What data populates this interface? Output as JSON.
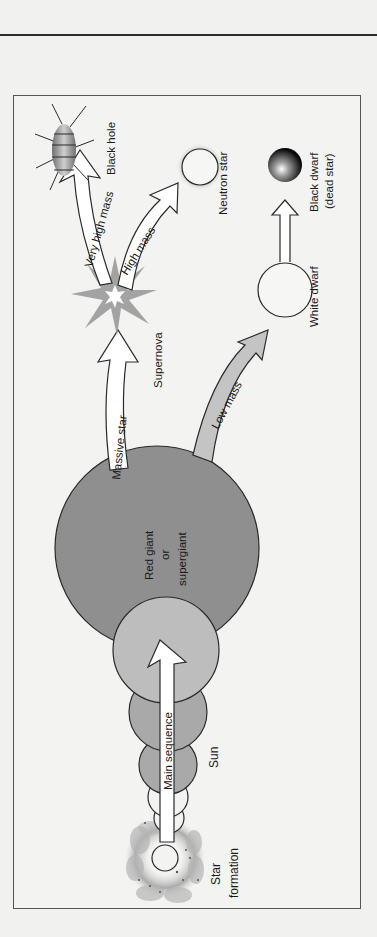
{
  "diagram": {
    "orientation": "rotated 90 degrees counter-clockwise",
    "stages": {
      "star_formation": {
        "line1": "Star",
        "line2": "formation"
      },
      "sun": "Sun",
      "main_sequence": "Main sequence",
      "red_giant": {
        "line1": "Red giant",
        "line2": "or",
        "line3": "supergiant"
      },
      "supernova": "Supernova",
      "black_hole": "Black hole",
      "neutron_star": "Neutron star",
      "white_dwarf": "White dwarf",
      "black_dwarf": {
        "line1": "Black dwarf",
        "line2": "(dead star)"
      }
    },
    "arrows": {
      "massive_star": "Massive star",
      "very_high_mass": "Very high mass",
      "high_mass": "High mass",
      "low_mass": "Low mass"
    },
    "colors": {
      "background": "#f1f1ef",
      "red_giant_fill": "#8f8f8f",
      "sun_fill": "#a9a9a9",
      "main_seq_fill": "#bdbdbd",
      "arrow_fill": "#ffffff",
      "outline": "#2a2a2a",
      "supernova": "#9a9a9a"
    }
  }
}
